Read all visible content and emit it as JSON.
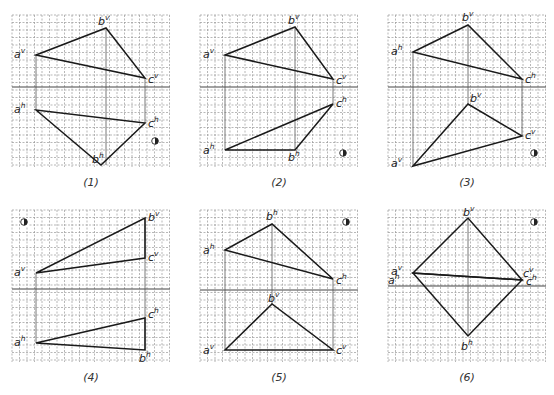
{
  "colors": {
    "grid": "#9a9a9a",
    "line": "#1a1a1a",
    "projector": "#555555",
    "axis": "#444444",
    "background": "#ffffff"
  },
  "grid": {
    "width": 158,
    "height": 152,
    "spacing": 7.5
  },
  "panels": [
    {
      "id": 1,
      "caption": "(1)",
      "origin": [
        12,
        15
      ],
      "axis_y": 72,
      "triangles": [
        {
          "view": "v",
          "points": {
            "a": [
              24,
              40
            ],
            "b": [
              94,
              13
            ],
            "c": [
              133,
              63
            ]
          }
        },
        {
          "view": "h",
          "points": {
            "a": [
              24,
              95
            ],
            "b": [
              89,
              150
            ],
            "c": [
              133,
              108
            ]
          }
        }
      ],
      "projectors": [
        [
          24,
          40,
          24,
          95
        ],
        [
          94,
          13,
          94,
          150
        ],
        [
          133,
          63,
          133,
          108
        ]
      ],
      "labels": [
        {
          "text": "a",
          "sup": "v",
          "x": 2,
          "y": 43
        },
        {
          "text": "b",
          "sup": "v",
          "x": 86,
          "y": 10
        },
        {
          "text": "c",
          "sup": "v",
          "x": 136,
          "y": 68
        },
        {
          "text": "a",
          "sup": "h",
          "x": 2,
          "y": 98
        },
        {
          "text": "c",
          "sup": "h",
          "x": 136,
          "y": 112
        },
        {
          "text": "b",
          "sup": "h",
          "x": 80,
          "y": 148
        }
      ],
      "eye_icon": [
        143,
        126
      ]
    },
    {
      "id": 2,
      "caption": "(2)",
      "origin": [
        200,
        15
      ],
      "axis_y": 72,
      "triangles": [
        {
          "view": "v",
          "points": {
            "a": [
              25,
              40
            ],
            "b": [
              95,
              12
            ],
            "c": [
              133,
              64
            ]
          }
        },
        {
          "view": "h",
          "points": {
            "a": [
              25,
              135
            ],
            "b": [
              95,
              135
            ],
            "c": [
              133,
              89
            ]
          }
        }
      ],
      "projectors": [
        [
          25,
          40,
          25,
          135
        ],
        [
          95,
          12,
          95,
          135
        ],
        [
          133,
          64,
          133,
          89
        ]
      ],
      "labels": [
        {
          "text": "a",
          "sup": "v",
          "x": 3,
          "y": 43
        },
        {
          "text": "b",
          "sup": "v",
          "x": 88,
          "y": 9
        },
        {
          "text": "c",
          "sup": "v",
          "x": 136,
          "y": 69
        },
        {
          "text": "c",
          "sup": "h",
          "x": 136,
          "y": 92
        },
        {
          "text": "a",
          "sup": "h",
          "x": 3,
          "y": 139
        },
        {
          "text": "b",
          "sup": "h",
          "x": 88,
          "y": 146
        }
      ],
      "eye_icon": [
        143,
        138
      ]
    },
    {
      "id": 3,
      "caption": "(3)",
      "origin": [
        388,
        15
      ],
      "axis_y": 72,
      "triangles": [
        {
          "view": "h",
          "points": {
            "a": [
              25,
              37
            ],
            "b": [
              80,
              10
            ],
            "c": [
              134,
              64
            ]
          }
        },
        {
          "view": "v",
          "points": {
            "a": [
              25,
              151
            ],
            "b": [
              80,
              89
            ],
            "c": [
              134,
              121
            ]
          }
        }
      ],
      "projectors": [
        [
          25,
          37,
          25,
          151
        ],
        [
          80,
          10,
          80,
          89
        ],
        [
          134,
          64,
          134,
          121
        ]
      ],
      "labels": [
        {
          "text": "a",
          "sup": "h",
          "x": 3,
          "y": 40
        },
        {
          "text": "b",
          "sup": "v",
          "x": 74,
          "y": 6
        },
        {
          "text": "c",
          "sup": "h",
          "x": 137,
          "y": 68
        },
        {
          "text": "b",
          "sup": "v",
          "x": 82,
          "y": 87
        },
        {
          "text": "c",
          "sup": "v",
          "x": 137,
          "y": 124
        },
        {
          "text": "a",
          "sup": "v",
          "x": 3,
          "y": 152
        }
      ],
      "eye_icon": [
        146,
        138
      ]
    },
    {
      "id": 4,
      "caption": "(4)",
      "origin": [
        12,
        210
      ],
      "axis_y": 79,
      "triangles": [
        {
          "view": "v",
          "points": {
            "a": [
              24,
              63
            ],
            "b": [
              133,
              8
            ],
            "c": [
              133,
              48
            ]
          }
        },
        {
          "view": "h",
          "points": {
            "a": [
              24,
              133
            ],
            "b": [
              133,
              140
            ],
            "c": [
              133,
              108
            ]
          }
        }
      ],
      "projectors": [
        [
          24,
          63,
          24,
          133
        ],
        [
          133,
          8,
          133,
          140
        ]
      ],
      "labels": [
        {
          "text": "b",
          "sup": "v",
          "x": 136,
          "y": 11
        },
        {
          "text": "c",
          "sup": "v",
          "x": 136,
          "y": 51
        },
        {
          "text": "a",
          "sup": "v",
          "x": 2,
          "y": 66
        },
        {
          "text": "c",
          "sup": "h",
          "x": 136,
          "y": 108
        },
        {
          "text": "a",
          "sup": "h",
          "x": 2,
          "y": 136
        },
        {
          "text": "b",
          "sup": "h",
          "x": 127,
          "y": 152
        }
      ],
      "eye_icon": [
        12,
        12
      ]
    },
    {
      "id": 5,
      "caption": "(5)",
      "origin": [
        200,
        210
      ],
      "axis_y": 80,
      "triangles": [
        {
          "view": "h",
          "points": {
            "a": [
              25,
              40
            ],
            "b": [
              72,
              14
            ],
            "c": [
              133,
              69
            ]
          }
        },
        {
          "view": "v",
          "points": {
            "a": [
              25,
              140
            ],
            "b": [
              72,
              94
            ],
            "c": [
              133,
              140
            ]
          }
        }
      ],
      "projectors": [
        [
          25,
          40,
          25,
          140
        ],
        [
          72,
          14,
          72,
          94
        ],
        [
          133,
          69,
          133,
          140
        ]
      ],
      "labels": [
        {
          "text": "b",
          "sup": "h",
          "x": 66,
          "y": 10
        },
        {
          "text": "a",
          "sup": "h",
          "x": 3,
          "y": 44
        },
        {
          "text": "c",
          "sup": "h",
          "x": 136,
          "y": 74
        },
        {
          "text": "b",
          "sup": "v",
          "x": 68,
          "y": 92
        },
        {
          "text": "a",
          "sup": "v",
          "x": 3,
          "y": 144
        },
        {
          "text": "c",
          "sup": "v",
          "x": 136,
          "y": 144
        }
      ],
      "eye_icon": [
        146,
        12
      ]
    },
    {
      "id": 6,
      "caption": "(6)",
      "origin": [
        388,
        210
      ],
      "axis_y": 76,
      "triangles": [
        {
          "view": "v",
          "points": {
            "a": [
              25,
              63
            ],
            "b": [
              80,
              8
            ],
            "c": [
              134,
              70
            ]
          }
        },
        {
          "view": "h",
          "points": {
            "a": [
              25,
              63
            ],
            "b": [
              80,
              126
            ],
            "c": [
              134,
              70
            ]
          }
        }
      ],
      "projectors": [
        [
          80,
          8,
          80,
          126
        ]
      ],
      "labels": [
        {
          "text": "b",
          "sup": "v",
          "x": 75,
          "y": 6
        },
        {
          "text": "a",
          "sup": "v",
          "x": 3,
          "y": 65
        },
        {
          "text": "a",
          "sup": "h",
          "x": 0,
          "y": 74
        },
        {
          "text": "c",
          "sup": "v",
          "x": 135,
          "y": 67
        },
        {
          "text": "c",
          "sup": "h",
          "x": 138,
          "y": 75
        },
        {
          "text": "b",
          "sup": "h",
          "x": 73,
          "y": 140
        }
      ],
      "eye_icon": [
        146,
        12
      ]
    }
  ]
}
